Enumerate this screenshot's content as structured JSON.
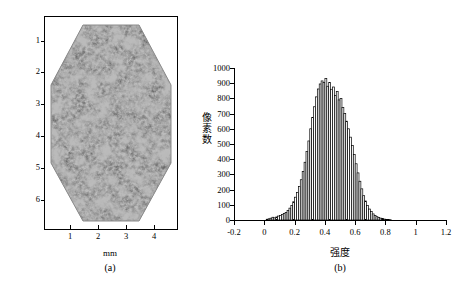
{
  "figure": {
    "panel_a": {
      "caption": "(a)",
      "xlabel": "mm",
      "ylabel": "",
      "xticks": [
        "1",
        "2",
        "3",
        "4"
      ],
      "yticks": [
        "1",
        "2",
        "3",
        "4",
        "5",
        "6"
      ],
      "image_name": "speckle-pattern-image",
      "description": "grayscale speckle pattern on hexagonal specimen"
    },
    "panel_b": {
      "caption": "(b)"
    }
  },
  "chart_data": {
    "type": "bar",
    "title": "",
    "xlabel": "强度",
    "ylabel": "像素数",
    "xlim": [
      -0.2,
      1.2
    ],
    "ylim": [
      0,
      1000
    ],
    "grid": false,
    "legend": null,
    "xticks": [
      "-0.2",
      "0",
      "0.2",
      "0.4",
      "0.6",
      "0.8",
      "1",
      "1.2"
    ],
    "xtick_values": [
      -0.2,
      0,
      0.2,
      0.4,
      0.6,
      0.8,
      1.0,
      1.2
    ],
    "yticks": [
      "0",
      "100",
      "200",
      "300",
      "400",
      "500",
      "600",
      "700",
      "800",
      "900",
      "1000"
    ],
    "ytick_values": [
      0,
      100,
      200,
      300,
      400,
      500,
      600,
      700,
      800,
      900,
      1000
    ],
    "bin_width": 0.0125,
    "x": [
      0.0125,
      0.025,
      0.0375,
      0.05,
      0.0625,
      0.075,
      0.0875,
      0.1,
      0.1125,
      0.125,
      0.1375,
      0.15,
      0.1625,
      0.175,
      0.1875,
      0.2,
      0.2125,
      0.225,
      0.2375,
      0.25,
      0.2625,
      0.275,
      0.2875,
      0.3,
      0.3125,
      0.325,
      0.3375,
      0.35,
      0.3625,
      0.375,
      0.3875,
      0.4,
      0.4125,
      0.425,
      0.4375,
      0.45,
      0.4625,
      0.475,
      0.4875,
      0.5,
      0.5125,
      0.525,
      0.5375,
      0.55,
      0.5625,
      0.575,
      0.5875,
      0.6,
      0.6125,
      0.625,
      0.6375,
      0.65,
      0.6625,
      0.675,
      0.6875,
      0.7,
      0.7125,
      0.725,
      0.7375,
      0.75,
      0.7625,
      0.775,
      0.7875,
      0.8,
      0.8125,
      0.825
    ],
    "values": [
      5,
      8,
      12,
      18,
      14,
      20,
      26,
      30,
      36,
      42,
      50,
      62,
      78,
      96,
      120,
      150,
      182,
      220,
      265,
      320,
      380,
      450,
      520,
      600,
      675,
      745,
      810,
      862,
      895,
      915,
      905,
      930,
      880,
      905,
      860,
      875,
      820,
      845,
      790,
      800,
      740,
      700,
      650,
      600,
      545,
      490,
      430,
      370,
      310,
      255,
      205,
      160,
      125,
      95,
      72,
      55,
      40,
      30,
      22,
      16,
      12,
      9,
      6,
      4,
      3,
      2
    ]
  }
}
